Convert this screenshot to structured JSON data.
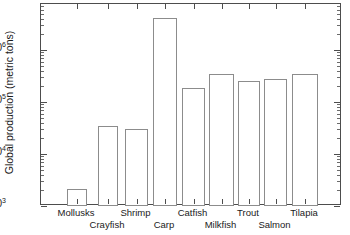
{
  "chart_data": {
    "type": "bar",
    "title": "",
    "xlabel": "",
    "ylabel": "Global production (metric tons)",
    "yscale": "log",
    "ylim": [
      1000,
      6000000
    ],
    "grid": false,
    "legend": null,
    "categories": [
      "Mollusks",
      "Crayfish",
      "Shrimp",
      "Carp",
      "Catfish",
      "Milkfish",
      "Trout",
      "Salmon",
      "Tilapia"
    ],
    "values": [
      2100,
      35000,
      30000,
      4200000,
      190000,
      350000,
      250000,
      280000,
      340000
    ],
    "ytick_labels": [
      "10",
      "10",
      "10",
      "10"
    ],
    "ytick_exponents": [
      "3",
      "4",
      "5",
      "6"
    ],
    "ytick_values": [
      1000,
      10000,
      100000,
      1000000
    ]
  },
  "axis": {
    "ylabel": "Global production (metric tons)",
    "yticks": [
      {
        "base": "10",
        "exp": "3",
        "value": 1000
      },
      {
        "base": "10",
        "exp": "4",
        "value": 10000
      },
      {
        "base": "10",
        "exp": "5",
        "value": 100000
      },
      {
        "base": "10",
        "exp": "6",
        "value": 1000000
      }
    ],
    "categories": [
      {
        "label": "Mollusks",
        "row": 0
      },
      {
        "label": "Crayfish",
        "row": 1
      },
      {
        "label": "Shrimp",
        "row": 0
      },
      {
        "label": "Carp",
        "row": 1
      },
      {
        "label": "Catfish",
        "row": 0
      },
      {
        "label": "Milkfish",
        "row": 1
      },
      {
        "label": "Trout",
        "row": 0
      },
      {
        "label": "Salmon",
        "row": 1
      },
      {
        "label": "Tilapia",
        "row": 0
      }
    ]
  },
  "colors": {
    "axis": "#4d4d4d",
    "bar_edge": "#8c8c8c",
    "bar_fill": "#ffffff",
    "text": "#1a1a1a",
    "background": "#ffffff"
  }
}
